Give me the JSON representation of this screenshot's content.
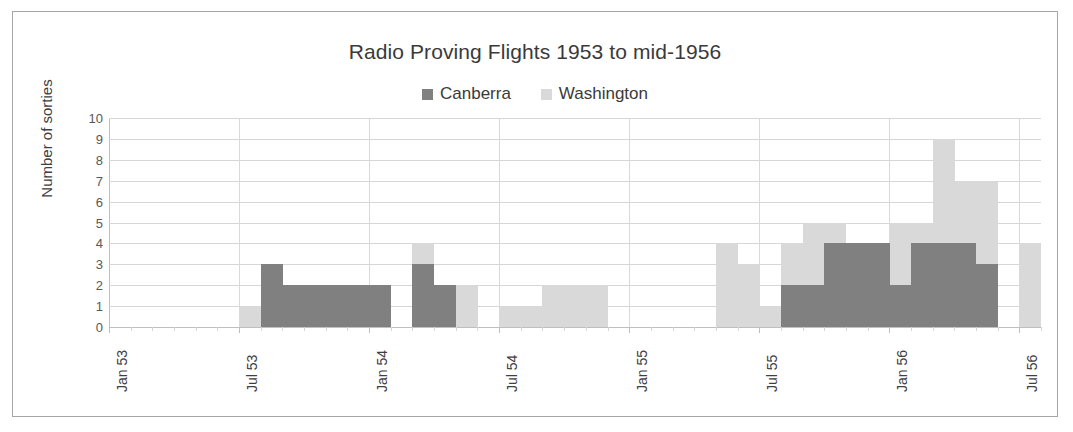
{
  "chart_data": {
    "type": "bar",
    "title": "Radio Proving Flights 1953 to mid-1956",
    "xlabel": "",
    "ylabel": "Number of sorties",
    "ylim": [
      0,
      10
    ],
    "ytick_values": [
      0,
      1,
      2,
      3,
      4,
      5,
      6,
      7,
      8,
      9,
      10
    ],
    "grid": true,
    "legend_position": "top-center",
    "colors": {
      "canberra": "#808080",
      "washington": "#d9d9d9",
      "gridline": "#d6d6d6",
      "axis": "#bfbfbf",
      "border": "#a6a6a6",
      "text": "#404040",
      "background": "#ffffff"
    },
    "x_axis_start": "Jan 53",
    "x_axis_end": "Jul 56",
    "x_tick_labels": [
      "Jan 53",
      "Jul 53",
      "Jan 54",
      "Jul 54",
      "Jan 55",
      "Jul 55",
      "Jan 56",
      "Jul 56"
    ],
    "x_tick_index": [
      0,
      6,
      12,
      18,
      24,
      30,
      36,
      42
    ],
    "categories": [
      "Jan 53",
      "Feb 53",
      "Mar 53",
      "Apr 53",
      "May 53",
      "Jun 53",
      "Jul 53",
      "Aug 53",
      "Sep 53",
      "Oct 53",
      "Nov 53",
      "Dec 53",
      "Jan 54",
      "Feb 54",
      "Mar 54",
      "Apr 54",
      "May 54",
      "Jun 54",
      "Jul 54",
      "Aug 54",
      "Sep 54",
      "Oct 54",
      "Nov 54",
      "Dec 54",
      "Jan 55",
      "Feb 55",
      "Mar 55",
      "Apr 55",
      "May 55",
      "Jun 55",
      "Jul 55",
      "Aug 55",
      "Sep 55",
      "Oct 55",
      "Nov 55",
      "Dec 55",
      "Jan 56",
      "Feb 56",
      "Mar 56",
      "Apr 56",
      "May 56",
      "Jun 56",
      "Jul 56"
    ],
    "series": [
      {
        "name": "Canberra",
        "color": "#808080",
        "values": [
          0,
          0,
          0,
          0,
          0,
          0,
          0,
          3,
          2,
          2,
          2,
          2,
          2,
          0,
          3,
          2,
          0,
          0,
          0,
          0,
          0,
          0,
          0,
          0,
          0,
          0,
          0,
          0,
          0,
          0,
          0,
          2,
          2,
          4,
          4,
          4,
          2,
          4,
          4,
          4,
          3,
          0,
          0
        ]
      },
      {
        "name": "Washington",
        "color": "#d9d9d9",
        "values": [
          0,
          0,
          0,
          0,
          0,
          0,
          1,
          0,
          0,
          0,
          0,
          0,
          0,
          0,
          4,
          1,
          2,
          0,
          1,
          1,
          2,
          2,
          2,
          0,
          0,
          0,
          0,
          0,
          4,
          3,
          1,
          4,
          5,
          5,
          4,
          4,
          5,
          5,
          9,
          7,
          7,
          0,
          4
        ]
      }
    ]
  },
  "legend": {
    "items": [
      {
        "label": "Canberra",
        "color": "#808080"
      },
      {
        "label": "Washington",
        "color": "#d9d9d9"
      }
    ]
  }
}
